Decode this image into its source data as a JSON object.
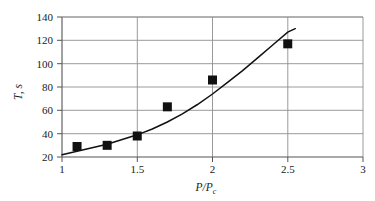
{
  "chart_data": {
    "type": "scatter",
    "title": "",
    "subtitle": "",
    "xlabel": "P/P_c",
    "xlabel_main": "P/P",
    "xlabel_sub": "c",
    "ylabel": "T, s",
    "ylabel_main": "T",
    "ylabel_rest": ", s",
    "xlim": [
      1,
      3
    ],
    "ylim": [
      20,
      140
    ],
    "xticks": [
      1,
      1.5,
      2,
      2.5,
      3
    ],
    "xtick_labels": [
      "1",
      "1.5",
      "2",
      "2.5",
      "3"
    ],
    "yticks": [
      20,
      40,
      60,
      80,
      100,
      120,
      140
    ],
    "ytick_labels": [
      "20",
      "40",
      "60",
      "80",
      "100",
      "120",
      "140"
    ],
    "grid": "horizontal-and-vertical-at-ticks",
    "legend": "none",
    "marker": "filled-square",
    "marker_color": "#111111",
    "line_color": "#111111",
    "background_color": "#ffffff",
    "grid_color": "#9a9a9a",
    "axis_color": "#555555",
    "series": [
      {
        "name": "measured",
        "kind": "scatter",
        "x": [
          1.1,
          1.3,
          1.5,
          1.7,
          2.0,
          2.5
        ],
        "values": [
          29,
          30,
          38,
          63,
          86,
          117
        ]
      },
      {
        "name": "fitted-curve",
        "kind": "line",
        "x": [
          1.0,
          1.1,
          1.2,
          1.3,
          1.4,
          1.5,
          1.6,
          1.7,
          1.8,
          1.9,
          2.0,
          2.1,
          2.2,
          2.3,
          2.4,
          2.5,
          2.55
        ],
        "values": [
          22,
          25,
          28,
          31,
          35,
          39,
          44,
          50,
          57,
          65,
          74,
          84,
          94,
          105,
          116,
          127,
          130
        ]
      }
    ]
  }
}
